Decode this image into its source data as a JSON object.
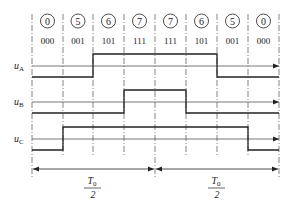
{
  "diagram": {
    "type": "svpwm-switching-timing",
    "states": [
      {
        "digit": "0",
        "code": "000"
      },
      {
        "digit": "5",
        "code": "001"
      },
      {
        "digit": "6",
        "code": "101"
      },
      {
        "digit": "7",
        "code": "111"
      },
      {
        "digit": "7",
        "code": "111"
      },
      {
        "digit": "6",
        "code": "101"
      },
      {
        "digit": "5",
        "code": "001"
      },
      {
        "digit": "0",
        "code": "000"
      }
    ],
    "signals": [
      {
        "label": "u",
        "subscript": "A",
        "high_from_slot": 2,
        "high_to_slot": 6
      },
      {
        "label": "u",
        "subscript": "B",
        "high_from_slot": 3,
        "high_to_slot": 5
      },
      {
        "label": "u",
        "subscript": "C",
        "high_from_slot": 1,
        "high_to_slot": 7
      }
    ],
    "periods": [
      {
        "numerator": "T",
        "numerator_sub": "0",
        "denominator": "2"
      },
      {
        "numerator": "T",
        "numerator_sub": "0",
        "denominator": "2"
      }
    ],
    "colors": {
      "line": "#222222",
      "axis": "#555555",
      "guide": "#666666"
    }
  }
}
